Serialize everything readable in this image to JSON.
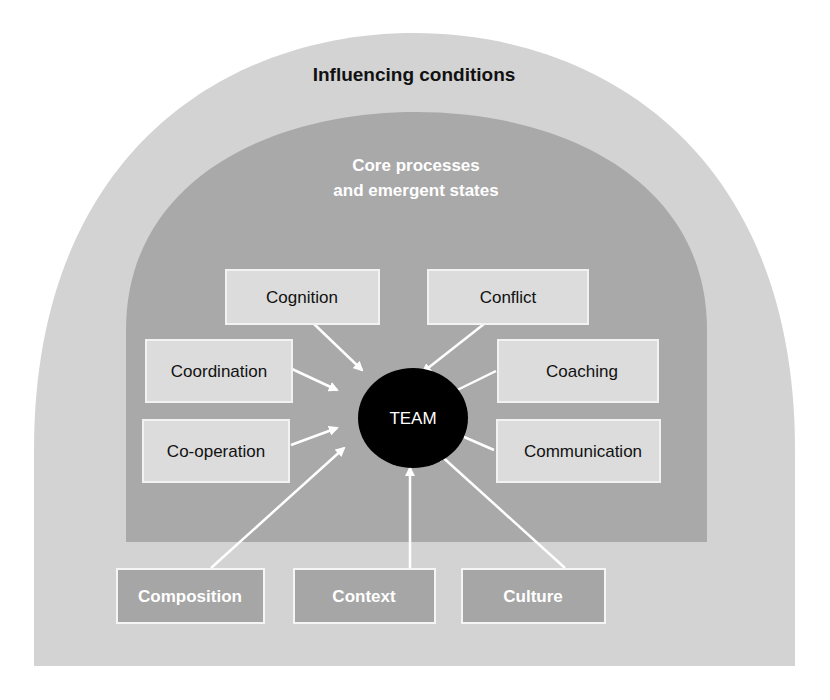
{
  "outer_region": {
    "title": "Influencing conditions"
  },
  "inner_region": {
    "title_line1": "Core processes",
    "title_line2": "and emergent states"
  },
  "center": {
    "label": "TEAM"
  },
  "process_boxes": [
    {
      "id": "cognition",
      "label": "Cognition"
    },
    {
      "id": "conflict",
      "label": "Conflict"
    },
    {
      "id": "coordination",
      "label": "Coordination"
    },
    {
      "id": "coaching",
      "label": "Coaching"
    },
    {
      "id": "co-operation",
      "label": "Co-operation"
    },
    {
      "id": "communication",
      "label": "Communication"
    }
  ],
  "condition_boxes": [
    {
      "id": "composition",
      "label": "Composition"
    },
    {
      "id": "context",
      "label": "Context"
    },
    {
      "id": "culture",
      "label": "Culture"
    }
  ],
  "colors": {
    "outer": "#d3d3d3",
    "inner": "#a9a9a9",
    "light_box": "#dcdcdc",
    "dark_box": "#a6a6a6",
    "team": "#000000",
    "arrow": "#ffffff"
  }
}
